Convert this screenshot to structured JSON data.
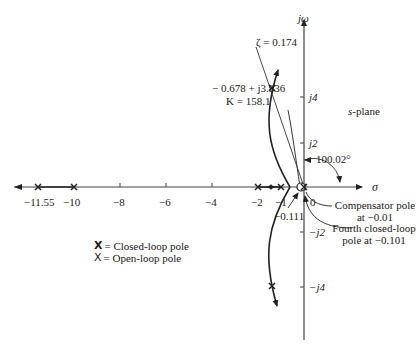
{
  "figure": {
    "plane_label": "s-plane",
    "axes": {
      "real_label": "σ",
      "imag_label": "jω",
      "real_ticks": [
        "−11.55",
        "−10",
        "−8",
        "−6",
        "−4",
        "−2",
        "−1",
        "0"
      ],
      "imag_ticks": [
        "j4",
        "j2",
        "−j2",
        "−j4"
      ]
    },
    "annotations": {
      "zeta": "ζ = 0.174",
      "point": "− 0.678 + j3.836",
      "gain": "K = 158.1",
      "angle": "100.02°",
      "zero_label": "−0.111",
      "compensator_line1": "Compensator pole",
      "compensator_line2": "at  −0.01",
      "fourth_line1": "Fourth closed-loop",
      "fourth_line2": "pole at  −0.101"
    },
    "legend": {
      "closed_loop": "= Closed-loop pole",
      "open_loop": "= Open-loop pole",
      "marker": "X"
    }
  }
}
